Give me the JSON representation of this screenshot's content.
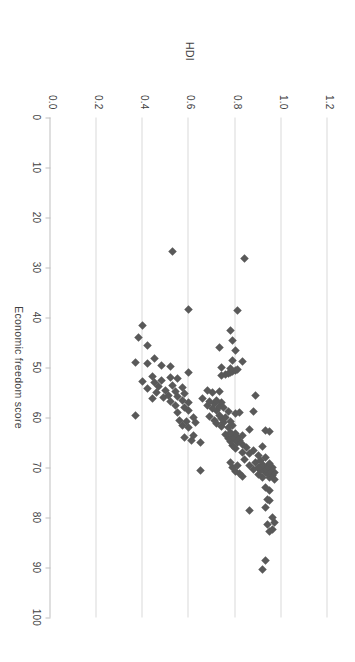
{
  "figure": {
    "background_color": "#ffffff",
    "marker_color": "#595959",
    "gridline_color": "#d9d9d9",
    "axis_color": "#bfbfbf",
    "text_color": "#3f3f3f",
    "rotation_degrees": 90
  },
  "chart_data": {
    "type": "scatter",
    "title": "",
    "xlabel": "Economic freedom score",
    "ylabel": "HDI",
    "xlim": [
      0,
      100
    ],
    "ylim": [
      0.0,
      1.2
    ],
    "xticks": [
      0,
      10,
      20,
      30,
      40,
      50,
      60,
      70,
      80,
      90,
      100
    ],
    "xticklabels": [
      "0",
      "10",
      "20",
      "30",
      "40",
      "50",
      "60",
      "70",
      "80",
      "90",
      "100"
    ],
    "yticks": [
      0.0,
      0.2,
      0.4,
      0.6,
      0.8,
      1.0,
      1.2
    ],
    "yticklabels": [
      "0.0",
      "0.2",
      "0.4",
      "0.6",
      "0.8",
      "1.0",
      "1.2"
    ],
    "grid": "horizontal-only",
    "legend": "none",
    "marker_shape": "diamond",
    "n_points": 150,
    "points": [
      [
        90.3,
        0.92
      ],
      [
        88.5,
        0.93
      ],
      [
        82.8,
        0.95
      ],
      [
        82.3,
        0.96
      ],
      [
        81.4,
        0.94
      ],
      [
        81.0,
        0.97
      ],
      [
        79.9,
        0.96
      ],
      [
        78.5,
        0.86
      ],
      [
        78.0,
        0.93
      ],
      [
        76.5,
        0.95
      ],
      [
        76.3,
        0.94
      ],
      [
        74.5,
        0.95
      ],
      [
        74.0,
        0.93
      ],
      [
        72.3,
        0.97
      ],
      [
        72.0,
        0.95
      ],
      [
        71.9,
        0.92
      ],
      [
        71.6,
        0.96
      ],
      [
        71.4,
        0.9
      ],
      [
        71.2,
        0.94
      ],
      [
        71.0,
        0.93
      ],
      [
        70.9,
        0.97
      ],
      [
        70.6,
        0.91
      ],
      [
        70.5,
        0.95
      ],
      [
        70.4,
        0.88
      ],
      [
        70.2,
        0.93
      ],
      [
        70.0,
        0.96
      ],
      [
        69.9,
        0.9
      ],
      [
        69.8,
        0.94
      ],
      [
        69.6,
        0.86
      ],
      [
        69.4,
        0.92
      ],
      [
        69.2,
        0.95
      ],
      [
        69.0,
        0.89
      ],
      [
        68.5,
        0.91
      ],
      [
        68.3,
        0.84
      ],
      [
        68.0,
        0.93
      ],
      [
        71.8,
        0.83
      ],
      [
        71.2,
        0.82
      ],
      [
        70.8,
        0.8
      ],
      [
        70.0,
        0.79
      ],
      [
        69.5,
        0.81
      ],
      [
        69.0,
        0.78
      ],
      [
        70.5,
        0.65
      ],
      [
        67.5,
        0.9
      ],
      [
        67.2,
        0.86
      ],
      [
        67.0,
        0.83
      ],
      [
        66.5,
        0.88
      ],
      [
        66.2,
        0.8
      ],
      [
        66.0,
        0.85
      ],
      [
        65.8,
        0.92
      ],
      [
        65.5,
        0.79
      ],
      [
        65.3,
        0.83
      ],
      [
        65.0,
        0.81
      ],
      [
        64.8,
        0.78
      ],
      [
        64.6,
        0.82
      ],
      [
        64.4,
        0.8
      ],
      [
        64.2,
        0.77
      ],
      [
        64.0,
        0.81
      ],
      [
        63.8,
        0.79
      ],
      [
        63.6,
        0.83
      ],
      [
        63.4,
        0.76
      ],
      [
        63.2,
        0.8
      ],
      [
        63.0,
        0.78
      ],
      [
        62.8,
        0.95
      ],
      [
        62.5,
        0.93
      ],
      [
        62.3,
        0.86
      ],
      [
        62.0,
        0.77
      ],
      [
        61.8,
        0.74
      ],
      [
        61.5,
        0.79
      ],
      [
        61.2,
        0.72
      ],
      [
        61.0,
        0.75
      ],
      [
        60.8,
        0.78
      ],
      [
        60.5,
        0.71
      ],
      [
        60.2,
        0.74
      ],
      [
        60.0,
        0.76
      ],
      [
        59.8,
        0.69
      ],
      [
        59.5,
        0.73
      ],
      [
        59.2,
        0.8
      ],
      [
        59.0,
        0.82
      ],
      [
        58.8,
        0.77
      ],
      [
        58.5,
        0.72
      ],
      [
        58.2,
        0.7
      ],
      [
        58.0,
        0.75
      ],
      [
        58.7,
        0.88
      ],
      [
        57.8,
        0.73
      ],
      [
        57.5,
        0.68
      ],
      [
        57.2,
        0.71
      ],
      [
        57.0,
        0.74
      ],
      [
        56.8,
        0.69
      ],
      [
        56.5,
        0.72
      ],
      [
        56.2,
        0.66
      ],
      [
        55.5,
        0.89
      ],
      [
        55.0,
        0.7
      ],
      [
        54.8,
        0.73
      ],
      [
        54.5,
        0.68
      ],
      [
        65.0,
        0.65
      ],
      [
        64.5,
        0.61
      ],
      [
        64.0,
        0.58
      ],
      [
        63.5,
        0.62
      ],
      [
        62.0,
        0.6
      ],
      [
        61.5,
        0.57
      ],
      [
        61.0,
        0.63
      ],
      [
        60.8,
        0.59
      ],
      [
        60.5,
        0.56
      ],
      [
        60.0,
        0.62
      ],
      [
        59.5,
        0.37
      ],
      [
        59.0,
        0.55
      ],
      [
        58.5,
        0.6
      ],
      [
        58.0,
        0.58
      ],
      [
        57.5,
        0.54
      ],
      [
        57.0,
        0.6
      ],
      [
        56.8,
        0.52
      ],
      [
        56.5,
        0.57
      ],
      [
        56.2,
        0.44
      ],
      [
        56.0,
        0.49
      ],
      [
        55.8,
        0.55
      ],
      [
        55.5,
        0.51
      ],
      [
        55.2,
        0.58
      ],
      [
        55.0,
        0.46
      ],
      [
        54.8,
        0.54
      ],
      [
        54.5,
        0.5
      ],
      [
        54.2,
        0.42
      ],
      [
        54.0,
        0.57
      ],
      [
        53.8,
        0.47
      ],
      [
        53.5,
        0.53
      ],
      [
        53.0,
        0.45
      ],
      [
        52.8,
        0.4
      ],
      [
        52.5,
        0.48
      ],
      [
        52.2,
        0.55
      ],
      [
        52.0,
        0.52
      ],
      [
        51.8,
        0.44
      ],
      [
        51.5,
        0.74
      ],
      [
        51.3,
        0.76
      ],
      [
        51.1,
        0.77
      ],
      [
        50.9,
        0.78
      ],
      [
        50.7,
        0.79
      ],
      [
        50.5,
        0.8
      ],
      [
        50.3,
        0.81
      ],
      [
        50.1,
        0.78
      ],
      [
        51.0,
        0.6
      ],
      [
        50.0,
        0.74
      ],
      [
        49.8,
        0.52
      ],
      [
        49.5,
        0.48
      ],
      [
        49.2,
        0.42
      ],
      [
        49.0,
        0.37
      ],
      [
        48.8,
        0.83
      ],
      [
        48.5,
        0.79
      ],
      [
        48.2,
        0.45
      ],
      [
        46.5,
        0.8
      ],
      [
        46.0,
        0.73
      ],
      [
        45.5,
        0.42
      ],
      [
        44.5,
        0.79
      ],
      [
        44.0,
        0.38
      ],
      [
        42.5,
        0.78
      ],
      [
        41.5,
        0.4
      ],
      [
        38.5,
        0.81
      ],
      [
        38.3,
        0.6
      ],
      [
        28.2,
        0.84
      ],
      [
        26.8,
        0.53
      ]
    ]
  },
  "axis_titles": {
    "x": "Economic freedom score",
    "y": "HDI"
  }
}
